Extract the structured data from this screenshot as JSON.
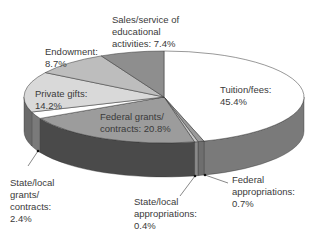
{
  "chart_data": {
    "type": "pie",
    "style": "3d-exploded-none",
    "title": "",
    "slices": [
      {
        "label": "Tuition/fees",
        "value": 45.4,
        "color": "#ffffff"
      },
      {
        "label": "Federal appropriations",
        "value": 0.7,
        "color": "#9a9a9a"
      },
      {
        "label": "State/local appropriations",
        "value": 0.4,
        "color": "#c8c8c8"
      },
      {
        "label": "Federal grants/contracts",
        "value": 20.8,
        "color": "#9c9c9c"
      },
      {
        "label": "State/local grants/contracts",
        "value": 2.4,
        "color": "#ffffff"
      },
      {
        "label": "Private gifts",
        "value": 14.2,
        "color": "#d9d9d9"
      },
      {
        "label": "Endowment",
        "value": 8.7,
        "color": "#bdbdbd"
      },
      {
        "label": "Sales/service of educational activities",
        "value": 7.4,
        "color": "#8e8e8e"
      }
    ],
    "legend": "none (direct labels)"
  },
  "labels": {
    "sales": "Sales/service of\neducational\nactivities: 7.4%",
    "endowment": "Endowment:\n8.7%",
    "private": "Private gifts:\n14.2%",
    "tuition": "Tuition/fees:\n45.4%",
    "federal_grants": "Federal grants/\ncontracts: 20.8%",
    "state_grants": "State/local\ngrants/\ncontracts:\n2.4%",
    "state_approp": "State/local\nappropriations:\n0.4%",
    "federal_approp": "Federal\nappropriations:\n0.7%"
  }
}
